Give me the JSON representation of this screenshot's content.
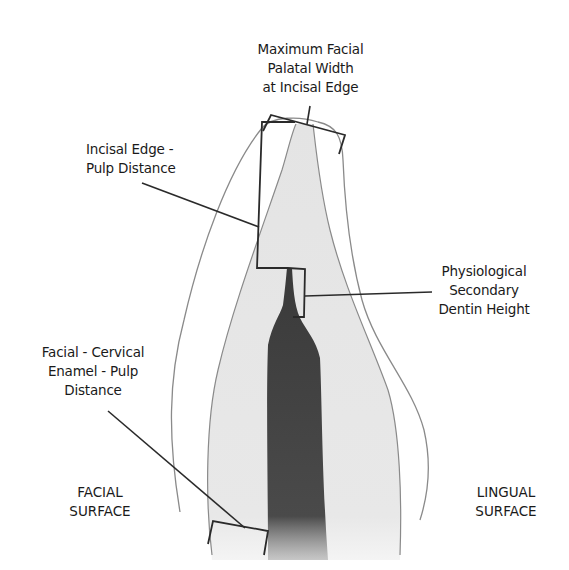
{
  "labels": {
    "max_width": {
      "lines": [
        "Maximum Facial",
        "Palatal Width",
        "at Incisal Edge"
      ]
    },
    "incisal_pulp": {
      "lines": [
        "Incisal Edge -",
        "Pulp Distance"
      ]
    },
    "secondary_dentin": {
      "lines": [
        "Physiological",
        "Secondary",
        "Dentin Height"
      ]
    },
    "cervical_enamel": {
      "lines": [
        "Facial - Cervical",
        "Enamel - Pulp",
        "Distance"
      ]
    },
    "facial_surface": {
      "lines": [
        "FACIAL",
        "SURFACE"
      ]
    },
    "lingual_surface": {
      "lines": [
        "LINGUAL",
        "SURFACE"
      ]
    }
  },
  "colors": {
    "outline": "#8a8a8a",
    "dentin": "#e6e6e6",
    "pulp": "#3c3c3c",
    "leader": "#2a2a2a",
    "text": "#1a1a1a"
  }
}
